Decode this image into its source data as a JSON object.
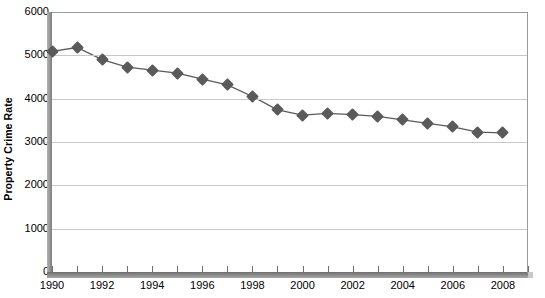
{
  "chart_data": {
    "type": "line",
    "title": "",
    "xlabel": "",
    "ylabel": "Property Crime Rate",
    "xlim": [
      1990,
      2009
    ],
    "ylim": [
      0,
      6000
    ],
    "grid": true,
    "legend": false,
    "marker": "diamond",
    "series_color": "#5a5a5a",
    "gridline_color": "#c8c8c8",
    "x": [
      1990,
      1991,
      1992,
      1993,
      1994,
      1995,
      1996,
      1997,
      1998,
      1999,
      2000,
      2001,
      2002,
      2003,
      2004,
      2005,
      2006,
      2007,
      2008
    ],
    "values": [
      5090,
      5180,
      4900,
      4730,
      4660,
      4590,
      4450,
      4320,
      4050,
      3740,
      3620,
      3660,
      3630,
      3590,
      3510,
      3430,
      3350,
      3230,
      3210
    ],
    "x_tick_labels": [
      "1990",
      "1992",
      "1994",
      "1996",
      "1998",
      "2000",
      "2002",
      "2004",
      "2006",
      "2008"
    ],
    "x_tick_values": [
      1990,
      1992,
      1994,
      1996,
      1998,
      2000,
      2002,
      2004,
      2006,
      2008
    ],
    "x_minor_ticks": [
      1990,
      1991,
      1992,
      1993,
      1994,
      1995,
      1996,
      1997,
      1998,
      1999,
      2000,
      2001,
      2002,
      2003,
      2004,
      2005,
      2006,
      2007,
      2008,
      2009
    ],
    "y_tick_labels": [
      "6000",
      "5000",
      "4000",
      "3000",
      "2000",
      "1000",
      "0"
    ],
    "y_tick_values": [
      6000,
      5000,
      4000,
      3000,
      2000,
      1000,
      0
    ]
  }
}
